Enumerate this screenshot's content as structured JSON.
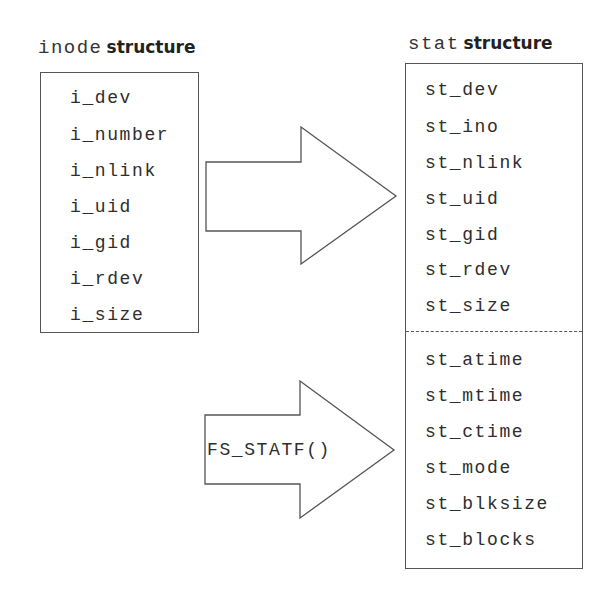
{
  "inode": {
    "title_code": "inode",
    "title_word": "structure",
    "fields": [
      "i_dev",
      "i_number",
      "i_nlink",
      "i_uid",
      "i_gid",
      "i_rdev",
      "i_size"
    ]
  },
  "stat": {
    "title_code": "stat",
    "title_word": "structure",
    "fields_copied": [
      "st_dev",
      "st_ino",
      "st_nlink",
      "st_uid",
      "st_gid",
      "st_rdev",
      "st_size"
    ],
    "fields_fs": [
      "st_atime",
      "st_mtime",
      "st_ctime",
      "st_mode",
      "st_blksize",
      "st_blocks"
    ]
  },
  "arrows": {
    "copy_arrow_label": "",
    "fs_arrow_label": "FS_STATF()"
  }
}
